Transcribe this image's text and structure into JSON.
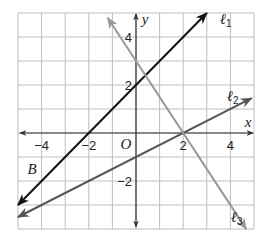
{
  "chart_data": {
    "type": "line",
    "title": "",
    "xlabel": "x",
    "ylabel": "y",
    "xlim": [
      -5,
      5
    ],
    "ylim": [
      -4,
      5
    ],
    "grid": true,
    "grid_step": 1,
    "origin_label": "O",
    "x_ticks": [
      {
        "value": -4,
        "label": "−4"
      },
      {
        "value": -2,
        "label": "−2"
      },
      {
        "value": 2,
        "label": "2"
      },
      {
        "value": 4,
        "label": "4"
      }
    ],
    "y_ticks": [
      {
        "value": 4,
        "label": "4"
      },
      {
        "value": 2,
        "label": "2"
      },
      {
        "value": -2,
        "label": "−2"
      }
    ],
    "series": [
      {
        "name": "l1",
        "label": "ℓ",
        "subscript": "1",
        "equation": "y = x + 2",
        "slope": 1,
        "intercept": 2,
        "color": "#111111",
        "x_range": [
          -5,
          3
        ]
      },
      {
        "name": "l2",
        "label": "ℓ",
        "subscript": "2",
        "equation": "y = 0.5x - 1",
        "slope": 0.5,
        "intercept": -1,
        "color": "#555555",
        "x_range": [
          -5,
          4.9
        ]
      },
      {
        "name": "l3",
        "label": "ℓ",
        "subscript": "3",
        "equation": "y = -1.5x + 3",
        "slope": -1.5,
        "intercept": 3,
        "color": "#999999",
        "x_range": [
          -1.2,
          4.67
        ]
      }
    ],
    "annotations": [
      {
        "text": "B",
        "x": -4.4,
        "y": -1.7
      }
    ]
  }
}
